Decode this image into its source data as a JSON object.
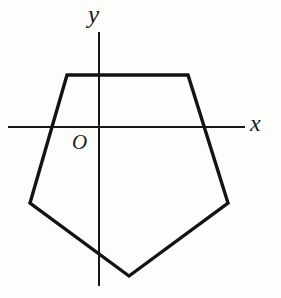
{
  "figure": {
    "kind": "geometry-diagram",
    "background_color": "#fdfdfc",
    "width": 281,
    "height": 298
  },
  "axes": {
    "x_axis": {
      "label": "x",
      "color": "#181818",
      "stroke_width": 2,
      "x_start": 8,
      "x_end": 245,
      "y": 127
    },
    "y_axis": {
      "label": "y",
      "color": "#181818",
      "stroke_width": 2,
      "y_start": 32,
      "y_end": 286,
      "x": 99
    },
    "origin": {
      "label": "O",
      "x": 99,
      "y": 127
    }
  },
  "shape": {
    "name": "pentagon",
    "stroke_color": "#131313",
    "stroke_width": 3.4,
    "fill": "none",
    "vertex_count": 5,
    "points": "67,75 188,75 228,203 129,276 30,203",
    "vertices": [
      {
        "name": "top-left",
        "x": 67,
        "y": 75
      },
      {
        "name": "top-right",
        "x": 188,
        "y": 75
      },
      {
        "name": "right",
        "x": 228,
        "y": 203
      },
      {
        "name": "bottom",
        "x": 129,
        "y": 276
      },
      {
        "name": "left",
        "x": 30,
        "y": 203
      }
    ]
  }
}
